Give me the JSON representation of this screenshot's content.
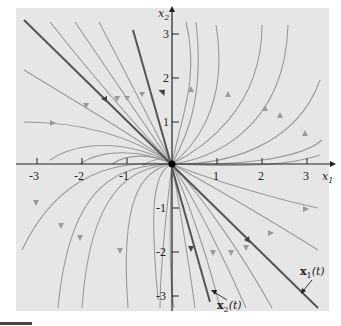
{
  "figure": {
    "type": "phase_portrait",
    "axes": {
      "x_label": "x",
      "x_sub": "1",
      "y_label": "x",
      "y_sub": "2",
      "x_ticks": [
        "-3",
        "-2",
        "-1",
        "1",
        "2",
        "3"
      ],
      "y_ticks": [
        "3",
        "2",
        "1",
        "-1",
        "-2",
        "-3"
      ],
      "xlim": [
        -3.4,
        3.5
      ],
      "ylim": [
        -3.4,
        3.6
      ]
    },
    "equilibrium": {
      "x": 0,
      "y": 0,
      "label": "origin"
    },
    "solution_labels": {
      "x1": {
        "bold": "x",
        "sub": "1",
        "arg": "(t)"
      },
      "x2": {
        "bold": "x",
        "sub": "2",
        "arg": "(t)"
      }
    },
    "eigen_lines": [
      {
        "name": "x1(t)",
        "direction": [
          1,
          -1
        ],
        "from": [
          -3.3,
          3.3
        ],
        "to": [
          3.25,
          -3.25
        ]
      },
      {
        "name": "x2(t)",
        "direction": [
          1,
          -3.6
        ],
        "from": [
          -0.87,
          3.05
        ],
        "to": [
          0.85,
          -3.15
        ]
      }
    ],
    "trajectory_count": 20,
    "colors": {
      "background": "#e6e6e6",
      "trajectory": "#9a9a9a",
      "eigenline": "#555555",
      "axis": "#222222"
    }
  }
}
